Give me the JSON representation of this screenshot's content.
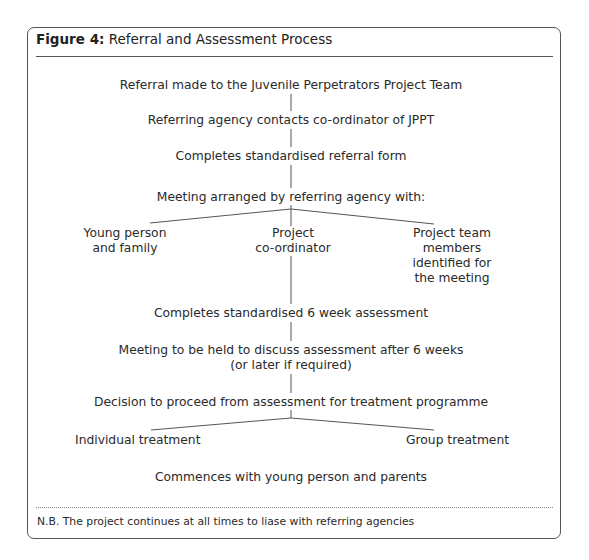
{
  "figure": {
    "label": "Figure 4:",
    "title": "Referral and Assessment Process"
  },
  "flow": {
    "step1": "Referral made to the Juvenile Perpetrators Project Team",
    "step2": "Referring agency contacts co-ordinator of JPPT",
    "step3": "Completes standardised referral form",
    "step4": "Meeting arranged by referring agency with:",
    "meeting_with": [
      {
        "lines": [
          "Young person",
          "and family"
        ]
      },
      {
        "lines": [
          "Project",
          "co-ordinator"
        ]
      },
      {
        "lines": [
          "Project team",
          "members",
          "identified for",
          "the meeting"
        ]
      }
    ],
    "step5": "Completes standardised 6 week assessment",
    "step6": {
      "line1": "Meeting to be held to discuss assessment after 6 weeks",
      "line2": "(or later if required)"
    },
    "step7": "Decision to proceed from assessment for treatment programme",
    "treatment_options": [
      {
        "label": "Individual treatment"
      },
      {
        "label": "Group treatment"
      }
    ],
    "step8": "Commences with young person and parents"
  },
  "footnote": "N.B. The project continues at all times to liase with referring agencies",
  "colors": {
    "border": "#555555",
    "text": "#2a2a2a",
    "background": "#ffffff"
  }
}
